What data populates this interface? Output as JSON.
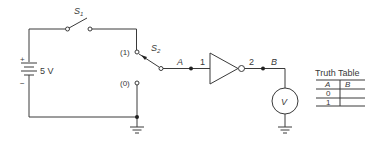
{
  "figure": {
    "type": "logic-circuit",
    "battery": {
      "label": "5 V",
      "plus": "+",
      "minus": "−"
    },
    "switch1": {
      "label": "S",
      "subscript": "1"
    },
    "switch2": {
      "label": "S",
      "subscript": "2",
      "position_1": "(1)",
      "position_0": "(0)"
    },
    "nodes": {
      "input": "A",
      "output": "B"
    },
    "inverter": {
      "pin_in": "1",
      "pin_out": "2"
    },
    "voltmeter": {
      "symbol": "V"
    },
    "truth_table": {
      "title": "Truth Table",
      "headers": [
        "A",
        "B"
      ],
      "rows": [
        [
          "0",
          ""
        ],
        [
          "1",
          ""
        ]
      ]
    }
  },
  "colors": {
    "ink": "#3a3a3a",
    "background": "#ffffff"
  }
}
